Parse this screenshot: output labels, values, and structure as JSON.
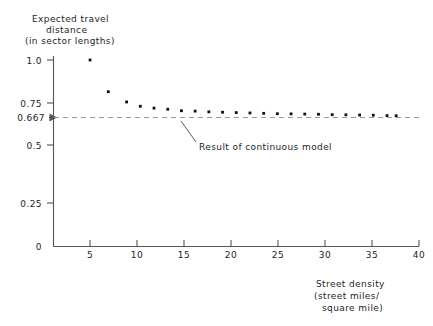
{
  "chart_data": {
    "type": "scatter",
    "title": "",
    "ylabel_lines": [
      "Expected travel",
      "distance",
      "(in sector lengths)"
    ],
    "xlabel_lines": [
      "Street density",
      "(street miles/",
      "square mile)"
    ],
    "xlabel": "Street density (street miles/ square mile)",
    "ylabel": "Expected travel distance (in sector lengths)",
    "xlim": [
      0,
      40
    ],
    "ylim": [
      0,
      1.08
    ],
    "grid": false,
    "legend": "none",
    "x_ticks": [
      5,
      10,
      15,
      20,
      25,
      30,
      35,
      40
    ],
    "x_tick_labels": [
      "5",
      "10",
      "15",
      "20",
      "25",
      "30",
      "35",
      "40"
    ],
    "y_ticks": [
      0,
      0.25,
      0.5,
      0.667,
      0.75,
      1.0
    ],
    "y_tick_labels": [
      "0",
      "0.25",
      "0.5",
      "0.667",
      "0.75",
      "1.0"
    ],
    "x": [
      4,
      6,
      8,
      9.5,
      11,
      12.5,
      14,
      15.5,
      17,
      18.5,
      20,
      21.5,
      23,
      24.5,
      26,
      27.5,
      29,
      30.5,
      32,
      33.5,
      35,
      36.5,
      37.5
    ],
    "y": [
      1.0,
      0.83,
      0.775,
      0.752,
      0.742,
      0.736,
      0.728,
      0.726,
      0.722,
      0.72,
      0.718,
      0.716,
      0.714,
      0.712,
      0.711,
      0.71,
      0.709,
      0.707,
      0.706,
      0.705,
      0.704,
      0.702,
      0.701
    ],
    "reference_line": {
      "value": 0.667,
      "label": "Result of continuous model",
      "style": "dashed"
    },
    "annotations": [
      {
        "text": "Result of continuous model",
        "points_to_x": 15.5,
        "points_to_y": 0.667
      }
    ]
  }
}
